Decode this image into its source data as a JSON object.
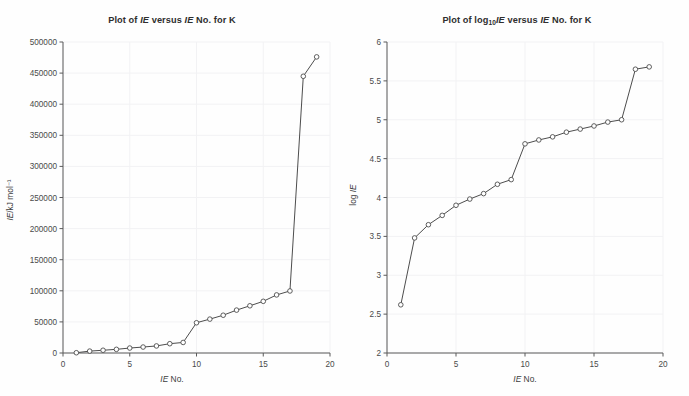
{
  "chart_data": [
    {
      "type": "line",
      "title": "Plot of IE versus IE No. for K",
      "title_parts": {
        "prefix": "Plot of ",
        "ital1": "IE",
        "mid": " versus ",
        "ital2": "IE",
        "suffix": " No. for K"
      },
      "xlabel": "IE No.",
      "xlabel_parts": {
        "ital": "IE",
        "rest": " No."
      },
      "ylabel": "IE/kJ mol⁻¹",
      "ylabel_parts": {
        "ital": "IE",
        "rest": "/kJ mol⁻¹"
      },
      "x": [
        1,
        2,
        3,
        4,
        5,
        6,
        7,
        8,
        9,
        10,
        11,
        12,
        13,
        14,
        15,
        16,
        17,
        18,
        19
      ],
      "values": [
        419,
        3052,
        4420,
        5877,
        7975,
        9590,
        11343,
        14944,
        16964,
        48610,
        54490,
        60730,
        68950,
        75900,
        83080,
        93400,
        99710,
        444880,
        476063
      ],
      "xlim": [
        0,
        20
      ],
      "ylim": [
        0,
        500000
      ],
      "xticks": [
        "0",
        "5",
        "10",
        "15",
        "20"
      ],
      "xtick_values": [
        0,
        5,
        10,
        15,
        20
      ],
      "yticks": [
        "0",
        "50000",
        "100000",
        "150000",
        "200000",
        "250000",
        "300000",
        "350000",
        "400000",
        "450000",
        "500000"
      ],
      "ytick_values": [
        0,
        50000,
        100000,
        150000,
        200000,
        250000,
        300000,
        350000,
        400000,
        450000,
        500000
      ],
      "grid": true,
      "legend": "none",
      "marker": "open-circle",
      "line_color": "#4d4d4d",
      "marker_fill": "#ffffff",
      "grid_color": "#f2f2f4"
    },
    {
      "type": "line",
      "title": "Plot of log10 IE versus IE No. for K",
      "title_parts": {
        "prefix": "Plot of log",
        "sub": "10",
        "ital1": "IE",
        "mid": " versus ",
        "ital2": "IE",
        "suffix": " No. for K"
      },
      "xlabel": "IE No.",
      "xlabel_parts": {
        "ital": "IE",
        "rest": " No."
      },
      "ylabel": "log IE",
      "ylabel_parts": {
        "prefix": "log ",
        "ital": "IE"
      },
      "x": [
        1,
        2,
        3,
        4,
        5,
        6,
        7,
        8,
        9,
        10,
        11,
        12,
        13,
        14,
        15,
        16,
        17,
        18,
        19
      ],
      "values": [
        2.62,
        3.48,
        3.65,
        3.77,
        3.9,
        3.98,
        4.05,
        4.17,
        4.23,
        4.69,
        4.74,
        4.78,
        4.84,
        4.88,
        4.92,
        4.97,
        5.0,
        5.65,
        5.68
      ],
      "xlim": [
        0,
        20
      ],
      "ylim": [
        2,
        6
      ],
      "xticks": [
        "0",
        "5",
        "10",
        "15",
        "20"
      ],
      "xtick_values": [
        0,
        5,
        10,
        15,
        20
      ],
      "yticks": [
        "2",
        "2.5",
        "3",
        "3.5",
        "4",
        "4.5",
        "5",
        "5.5",
        "6"
      ],
      "ytick_values": [
        2,
        2.5,
        3,
        3.5,
        4,
        4.5,
        5,
        5.5,
        6
      ],
      "grid": true,
      "legend": "none",
      "marker": "open-circle",
      "line_color": "#4d4d4d",
      "marker_fill": "#ffffff",
      "grid_color": "#f2f2f4"
    }
  ],
  "page": {
    "background": "#fefefe",
    "axis_color": "#5a5a5a",
    "text_color": "#3c3c3c"
  }
}
